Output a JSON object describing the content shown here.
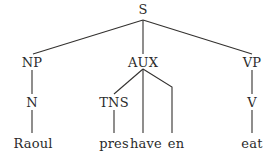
{
  "figure": {
    "kind": "syntax-tree",
    "sentence": "Raoul pres have en eat",
    "line_color": "#33312f",
    "text_color": "#2b2b2b",
    "background_color": "#ffffff",
    "width": 277,
    "height": 158
  },
  "nodes": {
    "s": {
      "label": "S",
      "x": 143,
      "y": 9
    },
    "np": {
      "label": "NP",
      "x": 32,
      "y": 62
    },
    "aux": {
      "label": "AUX",
      "x": 143,
      "y": 62
    },
    "vp": {
      "label": "VP",
      "x": 252,
      "y": 62
    },
    "n": {
      "label": "N",
      "x": 32,
      "y": 102
    },
    "tns": {
      "label": "TNS",
      "x": 114,
      "y": 102
    },
    "v": {
      "label": "V",
      "x": 252,
      "y": 102
    }
  },
  "leaves": {
    "raoul": {
      "label": "Raoul",
      "x": 33,
      "y": 143
    },
    "pres": {
      "label": "pres",
      "x": 114,
      "y": 143
    },
    "have": {
      "label": "have",
      "x": 146,
      "y": 143
    },
    "en": {
      "label": "en",
      "x": 176,
      "y": 143
    },
    "eat": {
      "label": "eat",
      "x": 252,
      "y": 143
    }
  },
  "edges": [
    {
      "name": "edge-s-np",
      "from": "S",
      "to": "NP",
      "path": "M143,20 L33,54"
    },
    {
      "name": "edge-s-aux",
      "from": "S",
      "to": "AUX",
      "path": "M143,20 L143,54"
    },
    {
      "name": "edge-s-vp",
      "from": "S",
      "to": "VP",
      "path": "M143,20 L252,54"
    },
    {
      "name": "edge-np-n",
      "from": "NP",
      "to": "N",
      "path": "M32,70 L32,94"
    },
    {
      "name": "edge-aux-tns",
      "from": "AUX",
      "to": "TNS",
      "path": "M143,69 L114,94"
    },
    {
      "name": "edge-aux-have",
      "from": "AUX",
      "to": "have",
      "path": "M143,69 L143,133"
    },
    {
      "name": "edge-aux-en",
      "from": "AUX",
      "to": "en",
      "path": "M143,69 L172,87 L172,133"
    },
    {
      "name": "edge-vp-v",
      "from": "VP",
      "to": "V",
      "path": "M252,70 L252,94"
    },
    {
      "name": "edge-n-raoul",
      "from": "N",
      "to": "Raoul",
      "path": "M32,110 L32,133"
    },
    {
      "name": "edge-tns-pres",
      "from": "TNS",
      "to": "pres",
      "path": "M114,110 L114,133"
    },
    {
      "name": "edge-v-eat",
      "from": "V",
      "to": "eat",
      "path": "M252,110 L252,133"
    }
  ]
}
